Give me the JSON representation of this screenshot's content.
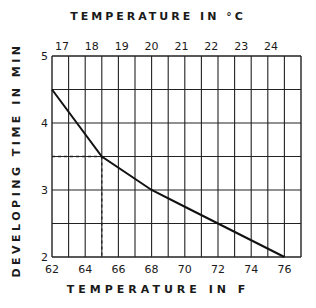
{
  "chart_data": {
    "type": "line",
    "title": "",
    "xlabel": "TEMPERATURE IN F",
    "x2label": "TEMPERATURE IN °C",
    "ylabel": "DEVELOPING TIME IN MIN",
    "x_ticks": [
      62,
      64,
      66,
      68,
      70,
      72,
      74,
      76
    ],
    "x2_ticks": [
      17,
      18,
      19,
      20,
      21,
      22,
      23,
      24
    ],
    "y_ticks": [
      2,
      3,
      4,
      5
    ],
    "xlim": [
      62,
      77
    ],
    "ylim": [
      2,
      5
    ],
    "grid": true,
    "series": [
      {
        "name": "developing time",
        "x": [
          62,
          65,
          68,
          70,
          72,
          76
        ],
        "y": [
          4.5,
          3.5,
          3.0,
          2.75,
          2.5,
          2.0
        ]
      }
    ],
    "annotations": [
      {
        "type": "dashed-guide",
        "x": 65,
        "y": 3.5,
        "description": "dotted lines from point (65°F, 3.5 min) to both axes"
      }
    ]
  },
  "labels": {
    "top": "TEMPERATURE IN °C",
    "bottom": "TEMPERATURE IN F",
    "left": "DEVELOPING TIME IN MIN"
  }
}
